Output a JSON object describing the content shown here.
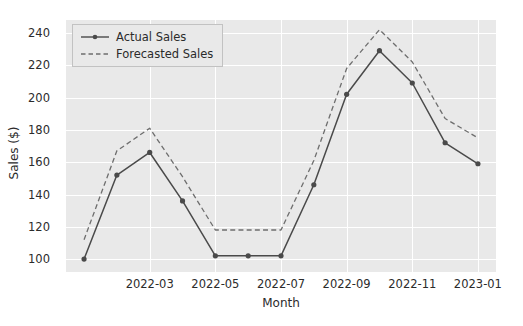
{
  "chart_data": {
    "type": "line",
    "title": "",
    "xlabel": "Month",
    "ylabel": "Sales ($)",
    "x": [
      "2022-01",
      "2022-02",
      "2022-03",
      "2022-04",
      "2022-05",
      "2022-06",
      "2022-07",
      "2022-08",
      "2022-09",
      "2022-10",
      "2022-11",
      "2022-12",
      "2023-01"
    ],
    "xtick_labels": [
      "2022-03",
      "2022-05",
      "2022-07",
      "2022-09",
      "2022-11",
      "2023-01"
    ],
    "xtick_values": [
      "2022-03",
      "2022-05",
      "2022-07",
      "2022-09",
      "2022-11",
      "2023-01"
    ],
    "ytick_labels": [
      "100",
      "120",
      "140",
      "160",
      "180",
      "200",
      "220",
      "240"
    ],
    "ytick_values": [
      100,
      120,
      140,
      160,
      180,
      200,
      220,
      240
    ],
    "ylim": [
      92,
      248
    ],
    "xlim": [
      -0.55,
      12.55
    ],
    "grid": true,
    "legend_position": "upper left",
    "series": [
      {
        "name": "Actual Sales",
        "style": "solid",
        "marker": "circle",
        "color": "#4a4a4a",
        "values": [
          100,
          152,
          166,
          136,
          102,
          102,
          102,
          146,
          202,
          229,
          209,
          172,
          159
        ]
      },
      {
        "name": "Forecasted Sales",
        "style": "dashed",
        "marker": "none",
        "color": "#6e6e6e",
        "values": [
          112,
          167,
          181,
          151,
          118,
          118,
          118,
          161,
          218,
          242,
          222,
          187,
          175
        ]
      }
    ]
  }
}
